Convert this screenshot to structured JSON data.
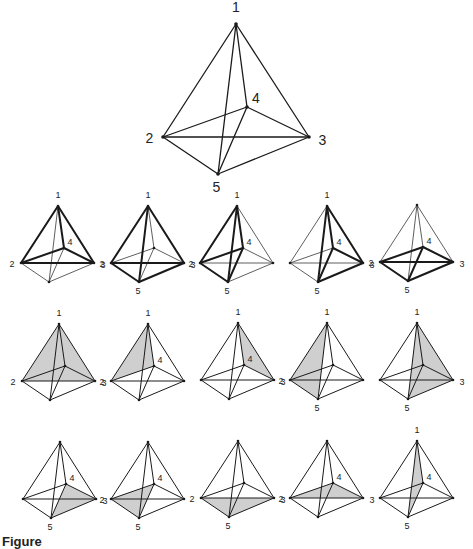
{
  "caption": "Figure",
  "colors": {
    "line": "#1a1a1a",
    "shade": "#cfcfcf",
    "bg": "#ffffff"
  },
  "edges": [
    [
      1,
      2
    ],
    [
      1,
      3
    ],
    [
      1,
      4
    ],
    [
      1,
      5
    ],
    [
      2,
      3
    ],
    [
      2,
      4
    ],
    [
      2,
      5
    ],
    [
      3,
      4
    ],
    [
      3,
      5
    ],
    [
      4,
      5
    ]
  ],
  "main_figure": {
    "vertices": {
      "1": [
        236,
        24
      ],
      "2": [
        163,
        137
      ],
      "3": [
        309,
        137
      ],
      "4": [
        247,
        107
      ],
      "5": [
        218,
        174
      ]
    },
    "labels": {
      "1": "1",
      "2": "2",
      "3": "3",
      "4": "4",
      "5": "5"
    }
  },
  "small_shape": {
    "1": [
      37,
      -57
    ],
    "2": [
      0,
      0
    ],
    "3": [
      73,
      0
    ],
    "4": [
      43,
      -15
    ],
    "5": [
      28,
      19
    ]
  },
  "small_figures": [
    {
      "row": 0,
      "col": 0,
      "origin": [
        21,
        263
      ],
      "bold": [
        1,
        2,
        3,
        4
      ],
      "labels": [
        "1",
        "2",
        "3",
        "4"
      ]
    },
    {
      "row": 0,
      "col": 1,
      "origin": [
        111,
        263
      ],
      "bold": [
        1,
        2,
        3,
        5
      ],
      "labels": [
        "1",
        "2",
        "3",
        "5"
      ]
    },
    {
      "row": 0,
      "col": 2,
      "origin": [
        200,
        263
      ],
      "bold": [
        1,
        2,
        4,
        5
      ],
      "labels": [
        "1",
        "2",
        "4",
        "5"
      ]
    },
    {
      "row": 0,
      "col": 3,
      "origin": [
        290,
        263
      ],
      "bold": [
        1,
        3,
        4,
        5
      ],
      "labels": [
        "1",
        "3",
        "4",
        "5"
      ]
    },
    {
      "row": 0,
      "col": 4,
      "origin": [
        380,
        262
      ],
      "bold": [
        2,
        3,
        4,
        5
      ],
      "labels": [
        "2",
        "3",
        "4",
        "5"
      ]
    },
    {
      "row": 1,
      "col": 0,
      "origin": [
        22,
        381
      ],
      "shade": [
        1,
        2,
        3
      ],
      "labels": [
        "1",
        "2",
        "3"
      ]
    },
    {
      "row": 1,
      "col": 1,
      "origin": [
        111,
        381
      ],
      "shade": [
        1,
        2,
        4
      ],
      "labels": [
        "1",
        "2",
        "4"
      ]
    },
    {
      "row": 1,
      "col": 2,
      "origin": [
        201,
        380
      ],
      "shade": [
        1,
        3,
        4
      ],
      "labels": [
        "1",
        "3",
        "4"
      ]
    },
    {
      "row": 1,
      "col": 3,
      "origin": [
        290,
        380
      ],
      "shade": [
        1,
        2,
        5
      ],
      "labels": [
        "1",
        "2",
        "5"
      ]
    },
    {
      "row": 1,
      "col": 4,
      "origin": [
        380,
        380
      ],
      "shade": [
        1,
        3,
        5
      ],
      "labels": [
        "1",
        "3",
        "5"
      ]
    },
    {
      "row": 2,
      "col": 0,
      "origin": [
        23,
        499
      ],
      "shade": [
        3,
        4,
        5
      ],
      "labels": [
        "3",
        "4",
        "5"
      ]
    },
    {
      "row": 2,
      "col": 1,
      "origin": [
        111,
        499
      ],
      "shade": [
        2,
        4,
        5
      ],
      "labels": [
        "2",
        "4",
        "5"
      ]
    },
    {
      "row": 2,
      "col": 2,
      "origin": [
        201,
        498
      ],
      "shade": [
        2,
        3,
        5
      ],
      "labels": [
        "2",
        "3",
        "5"
      ]
    },
    {
      "row": 2,
      "col": 3,
      "origin": [
        290,
        498
      ],
      "shade": [
        2,
        3,
        4
      ],
      "labels": [
        "2",
        "3",
        "4"
      ]
    },
    {
      "row": 2,
      "col": 4,
      "origin": [
        380,
        498
      ],
      "shade": [
        1,
        4,
        5
      ],
      "labels": [
        "1",
        "4",
        "5"
      ]
    }
  ]
}
